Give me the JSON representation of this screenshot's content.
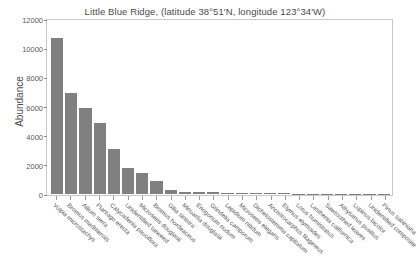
{
  "chart_data": {
    "type": "bar",
    "title": "Little Blue Ridge, (latitude 38°51′N, longitude 123°34′W)",
    "xlabel": "",
    "ylabel": "Abundance",
    "ylim": [
      0,
      12000
    ],
    "yticks": [
      0,
      2000,
      4000,
      6000,
      8000,
      10000,
      12000
    ],
    "ytick_labels": [
      "0",
      "2000",
      "4000",
      "6000",
      "8000",
      "10000",
      "12000"
    ],
    "grid": false,
    "legend": "none",
    "bar_color": "#808080",
    "categories": [
      "Vulpia microstachys",
      "Bromus madritensis",
      "Allium serra",
      "Plantago erecta",
      "Calycadenia pauciflora",
      "Unidentified tarweed",
      "Microseris douglasii",
      "Bromus hordeaceus",
      "Gilia sinistra",
      "Minuartia douglasii",
      "Eriogonum nudum",
      "Grindelia camporum",
      "Lepidium nitidum",
      "Microseris elegans",
      "Dichelostemma capitatum",
      "Ancistrocarphus filagineus",
      "Elymus elymoides",
      "Lotus humistratus",
      "Lasthenia californica",
      "Sawtoothed leaves",
      "Athysanus pusillus",
      "Lupinus bicolor",
      "Unidentified composite",
      "Pinus sabiniana"
    ],
    "values": [
      10800,
      7000,
      6000,
      4900,
      3100,
      1800,
      1450,
      900,
      300,
      150,
      120,
      110,
      100,
      90,
      70,
      55,
      45,
      35,
      30,
      25,
      20,
      15,
      12,
      10
    ]
  }
}
